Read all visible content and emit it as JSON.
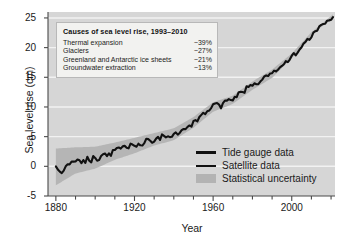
{
  "chart_data": {
    "type": "line",
    "title": "",
    "xlabel": "Year",
    "ylabel": "Sea level rise (cm)",
    "xlim": [
      1876,
      2022
    ],
    "ylim": [
      -5,
      26
    ],
    "xticks": [
      1880,
      1920,
      1960,
      2000
    ],
    "xticklabels": [
      "1880",
      "1920",
      "1960",
      "2000"
    ],
    "xminor_step": 10,
    "yticks": [
      -5,
      0,
      5,
      10,
      15,
      20,
      25
    ],
    "yticklabels": [
      "-5",
      "0",
      "5",
      "10",
      "15",
      "20",
      "25"
    ],
    "grid": "horizontal-white",
    "legend_position": "lower-right",
    "colors": {
      "plot_background": "#d6d6d6",
      "gridline": "#f2f2f2",
      "line": "#111111",
      "uncertainty_band": "#b3b3b3",
      "axis": "#4a4a4a",
      "text": "#1a1a1a",
      "infobox_background": "#f2f2f0",
      "infobox_border": "#b8b8b8"
    },
    "series": [
      {
        "name": "Tide gauge data",
        "x": [
          1880,
          1882,
          1884,
          1886,
          1888,
          1890,
          1892,
          1894,
          1896,
          1898,
          1900,
          1902,
          1904,
          1906,
          1908,
          1910,
          1912,
          1914,
          1916,
          1918,
          1920,
          1922,
          1924,
          1926,
          1928,
          1930,
          1932,
          1934,
          1936,
          1938,
          1940,
          1942,
          1944,
          1946,
          1948,
          1950,
          1952,
          1954,
          1956,
          1958,
          1960,
          1962,
          1964,
          1966,
          1968,
          1970,
          1972,
          1974,
          1976,
          1978,
          1980,
          1982,
          1984,
          1986,
          1988,
          1990,
          1992
        ],
        "values": [
          0.0,
          -1.1,
          -0.3,
          0.6,
          0.3,
          1.1,
          1.0,
          0.7,
          1.3,
          1.0,
          1.5,
          1.3,
          1.8,
          2.1,
          1.9,
          2.6,
          2.9,
          3.3,
          3.0,
          3.6,
          3.5,
          4.0,
          3.8,
          4.5,
          4.2,
          4.6,
          4.5,
          4.9,
          5.0,
          5.2,
          5.4,
          5.3,
          5.9,
          6.4,
          6.9,
          7.4,
          7.9,
          8.4,
          8.9,
          9.4,
          10.0,
          10.6,
          10.3,
          11.0,
          11.4,
          11.2,
          11.8,
          12.3,
          12.7,
          13.3,
          13.6,
          14.2,
          14.1,
          14.8,
          15.1,
          15.6,
          16.0
        ]
      },
      {
        "name": "Satellite data",
        "x": [
          1993,
          1995,
          1997,
          1999,
          2001,
          2003,
          2005,
          2007,
          2009,
          2011,
          2013,
          2015,
          2017,
          2019,
          2021
        ],
        "values": [
          16.3,
          16.9,
          17.5,
          18.0,
          18.8,
          19.5,
          20.2,
          20.8,
          21.6,
          22.3,
          22.9,
          23.6,
          24.2,
          24.7,
          25.4
        ]
      }
    ],
    "uncertainty": {
      "name": "Statistical uncertainty",
      "x": [
        1880,
        1890,
        1900,
        1910,
        1920,
        1930,
        1940,
        1950,
        1960,
        1970,
        1980,
        1990,
        2000,
        2010,
        2021
      ],
      "upper": [
        3.0,
        3.2,
        3.3,
        4.0,
        4.8,
        5.6,
        6.4,
        8.3,
        10.8,
        11.9,
        14.3,
        16.3,
        19.0,
        22.6,
        25.6
      ],
      "lower": [
        -3.2,
        -1.2,
        -0.4,
        1.1,
        2.2,
        3.5,
        4.4,
        6.5,
        9.2,
        10.5,
        12.9,
        14.9,
        18.2,
        22.0,
        25.2
      ]
    },
    "annotation_box": {
      "title": "Causes of sea level rise, 1993–2010",
      "rows": [
        {
          "label": "Thermal expansion",
          "value": "~39%"
        },
        {
          "label": "Glaciers",
          "value": "~27%"
        },
        {
          "label": "Greenland and Antarctic ice sheets",
          "value": "~21%"
        },
        {
          "label": "Groundwater extraction",
          "value": "~13%"
        }
      ]
    },
    "legend": [
      {
        "label": "Tide gauge data",
        "marker": "line-thick"
      },
      {
        "label": "Satellite data",
        "marker": "line-thin"
      },
      {
        "label": "Statistical uncertainty",
        "marker": "band"
      }
    ]
  }
}
